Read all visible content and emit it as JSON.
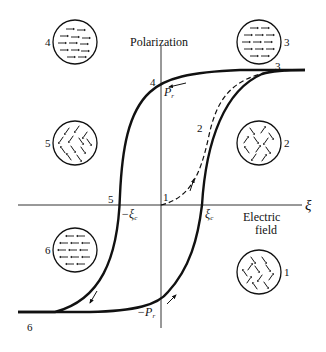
{
  "axes": {
    "y_label": "Polarization",
    "x_label_line1": "Electric",
    "x_label_line2": "field",
    "x_symbol": "ξ"
  },
  "markers": {
    "pr": "P",
    "pr_sub": "r",
    "neg_pr": "−P",
    "neg_pr_sub": "r",
    "xi_c": "ξ",
    "xi_c_sub": "c",
    "neg_xi_c": "−ξ",
    "neg_xi_c_sub": "c"
  },
  "curve_points": {
    "p1": "1",
    "p2": "2",
    "p3": "3",
    "p4": "4",
    "p5": "5",
    "p6": "6"
  },
  "domain_circles": [
    {
      "id": "1",
      "label": "1",
      "state": "random"
    },
    {
      "id": "2",
      "label": "2",
      "state": "random"
    },
    {
      "id": "3",
      "label": "3",
      "state": "aligned-right"
    },
    {
      "id": "4",
      "label": "4",
      "state": "aligned-right"
    },
    {
      "id": "5",
      "label": "5",
      "state": "partially-random"
    },
    {
      "id": "6",
      "label": "6",
      "state": "aligned-left"
    }
  ]
}
